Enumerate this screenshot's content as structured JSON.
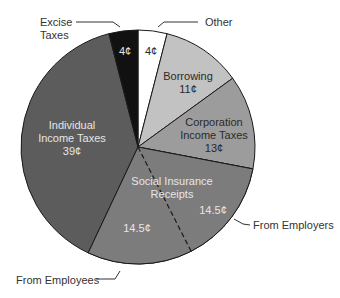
{
  "chart_data": {
    "type": "pie",
    "title": "",
    "unit": "cents per dollar",
    "center": [
      138,
      147
    ],
    "radius": 117,
    "start_angle_deg": 0,
    "direction": "clockwise",
    "slices": [
      {
        "name": "Other",
        "value": 4,
        "label": "4¢",
        "color": "#ffffff"
      },
      {
        "name": "Borrowing",
        "value": 11,
        "label": "11¢",
        "color": "#c2c2c2"
      },
      {
        "name": "Corporation Income Taxes",
        "value": 13,
        "label": "13¢",
        "color": "#9c9c9c"
      },
      {
        "name": "Social Insurance Receipts - From Employers",
        "value": 14.5,
        "label": "14.5¢",
        "color": "#7c7c7c"
      },
      {
        "name": "Social Insurance Receipts - From Employees",
        "value": 14.5,
        "label": "14.5¢",
        "color": "#7c7c7c"
      },
      {
        "name": "Individual Income Taxes",
        "value": 39,
        "label": "39¢",
        "color": "#5c5c5c"
      },
      {
        "name": "Excise Taxes",
        "value": 4,
        "label": "4¢",
        "color": "#111111"
      }
    ]
  },
  "labels": {
    "excise_line1": "Excise",
    "excise_line2": "Taxes",
    "excise_value": "4¢",
    "other": "Other",
    "other_value": "4¢",
    "borrowing": "Borrowing",
    "borrowing_value": "11¢",
    "corp_line1": "Corporation",
    "corp_line2": "Income Taxes",
    "corp_value": "13¢",
    "individual_line1": "Individual",
    "individual_line2": "Income Taxes",
    "individual_value": "39¢",
    "social_line1": "Social Insurance",
    "social_line2": "Receipts",
    "employers_value": "14.5¢",
    "employees_value": "14.5¢",
    "from_employers": "From Employers",
    "from_employees": "From Employees"
  }
}
